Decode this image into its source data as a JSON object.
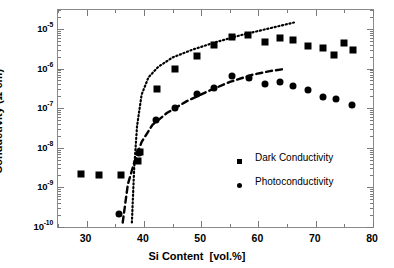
{
  "chart_data": {
    "type": "scatter",
    "title": "",
    "xlabel": "Si Content  [vol.%]",
    "ylabel": "Conductivity  (Ω cm)⁻¹",
    "xlim": [
      25,
      80
    ],
    "ylim": [
      1e-10,
      3e-05
    ],
    "yscale": "log",
    "xscale": "linear",
    "grid": false,
    "legend_position": "center-right",
    "xticks": [
      30,
      40,
      50,
      60,
      70,
      80
    ],
    "xtick_labels": [
      "30",
      "40",
      "50",
      "60",
      "70",
      "80"
    ],
    "yticks": [
      1e-10,
      1e-09,
      1e-08,
      1e-07,
      1e-06,
      1e-05
    ],
    "ytick_labels": [
      "10-10",
      "10-9",
      "10-8",
      "10-7",
      "10-6",
      "10-5"
    ],
    "ytick_mantissa": "10",
    "ytick_exponents": [
      "-10",
      "-9",
      "-8",
      "-7",
      "-6",
      "-5"
    ],
    "series": [
      {
        "name": "Dark Conductivity",
        "marker": "square",
        "color": "#000000",
        "points": [
          {
            "x": 29.0,
            "y": 2.2e-09
          },
          {
            "x": 32.1,
            "y": 2.1e-09
          },
          {
            "x": 36.0,
            "y": 2.1e-09
          },
          {
            "x": 38.9,
            "y": 4.6e-09
          },
          {
            "x": 39.3,
            "y": 8e-09
          },
          {
            "x": 42.3,
            "y": 3e-07
          },
          {
            "x": 45.5,
            "y": 1e-06
          },
          {
            "x": 49.2,
            "y": 2.1e-06
          },
          {
            "x": 52.2,
            "y": 4e-06
          },
          {
            "x": 55.3,
            "y": 6.1e-06
          },
          {
            "x": 58.2,
            "y": 7.2e-06
          },
          {
            "x": 61.1,
            "y": 4.6e-06
          },
          {
            "x": 63.8,
            "y": 5.8e-06
          },
          {
            "x": 66.0,
            "y": 5.1e-06
          },
          {
            "x": 68.7,
            "y": 3.8e-06
          },
          {
            "x": 71.2,
            "y": 3.3e-06
          },
          {
            "x": 73.2,
            "y": 2.2e-06
          },
          {
            "x": 74.9,
            "y": 4.3e-06
          },
          {
            "x": 76.5,
            "y": 2.9e-06
          }
        ]
      },
      {
        "name": "Photoconductivity",
        "marker": "circle",
        "color": "#000000",
        "points": [
          {
            "x": 35.6,
            "y": 2.1e-10
          },
          {
            "x": 39.2,
            "y": 7.5e-09
          },
          {
            "x": 42.1,
            "y": 5e-08
          },
          {
            "x": 45.4,
            "y": 1e-07
          },
          {
            "x": 49.2,
            "y": 2.3e-07
          },
          {
            "x": 52.2,
            "y": 3.3e-07
          },
          {
            "x": 55.4,
            "y": 6.5e-07
          },
          {
            "x": 58.3,
            "y": 5.9e-07
          },
          {
            "x": 61.1,
            "y": 4e-07
          },
          {
            "x": 63.7,
            "y": 4.6e-07
          },
          {
            "x": 66.0,
            "y": 3.6e-07
          },
          {
            "x": 68.6,
            "y": 2.8e-07
          },
          {
            "x": 71.2,
            "y": 1.9e-07
          },
          {
            "x": 73.5,
            "y": 1.7e-07
          },
          {
            "x": 76.4,
            "y": 1.2e-07
          }
        ]
      }
    ],
    "fits": [
      {
        "name": "dark-conductivity-fit",
        "style": "dotted",
        "points": [
          {
            "x": 37.9,
            "y": 1.3e-10
          },
          {
            "x": 38.3,
            "y": 3e-09
          },
          {
            "x": 38.8,
            "y": 3.5e-08
          },
          {
            "x": 39.6,
            "y": 2.2e-07
          },
          {
            "x": 40.8,
            "y": 6e-07
          },
          {
            "x": 42.5,
            "y": 1.1e-06
          },
          {
            "x": 45.0,
            "y": 1.9e-06
          },
          {
            "x": 48.5,
            "y": 3e-06
          },
          {
            "x": 52.5,
            "y": 4.6e-06
          },
          {
            "x": 57.0,
            "y": 7e-06
          },
          {
            "x": 61.5,
            "y": 1e-05
          },
          {
            "x": 66.2,
            "y": 1.45e-05
          }
        ]
      },
      {
        "name": "photoconductivity-fit",
        "style": "dashed",
        "points": [
          {
            "x": 36.3,
            "y": 1.3e-10
          },
          {
            "x": 37.2,
            "y": 1.2e-09
          },
          {
            "x": 38.3,
            "y": 4.2e-09
          },
          {
            "x": 39.6,
            "y": 1.4e-08
          },
          {
            "x": 41.5,
            "y": 3.8e-08
          },
          {
            "x": 44.0,
            "y": 7.5e-08
          },
          {
            "x": 47.5,
            "y": 1.5e-07
          },
          {
            "x": 51.0,
            "y": 2.6e-07
          },
          {
            "x": 55.0,
            "y": 4.6e-07
          },
          {
            "x": 59.0,
            "y": 7e-07
          },
          {
            "x": 62.0,
            "y": 8.6e-07
          },
          {
            "x": 64.2,
            "y": 9.6e-07
          }
        ]
      }
    ],
    "legend": [
      {
        "label": "Dark Conductivity",
        "marker": "square"
      },
      {
        "label": "Photoconductivity",
        "marker": "circle"
      }
    ]
  },
  "axes": {
    "y_title_main": "Conductivity  (Ω cm)",
    "y_title_sup": "-1",
    "x_title_main": "Si Content",
    "x_title_unit": "[vol.%]"
  },
  "legend": {
    "dark_label": "Dark Conductivity",
    "photo_label": "Photoconductivity"
  }
}
